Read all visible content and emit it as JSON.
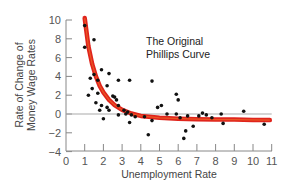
{
  "chart_data": {
    "type": "scatter",
    "title": "The Original Phillips Curve",
    "annotation": [
      "The Original",
      "Phillips Curve"
    ],
    "xlabel": "Unemployment Rate",
    "ylabel": [
      "Rate of Change of",
      "Money Wage Rates"
    ],
    "xlim": [
      0,
      11
    ],
    "ylim": [
      -4,
      10
    ],
    "x_ticks": [
      0,
      1,
      2,
      3,
      4,
      5,
      6,
      7,
      8,
      9,
      10,
      11
    ],
    "y_ticks": [
      10,
      8,
      6,
      4,
      2,
      0,
      -2,
      -4
    ],
    "grid": false,
    "zero_line": true,
    "series": [
      {
        "name": "Observations",
        "kind": "scatter",
        "color": "#111111",
        "points": [
          [
            1.0,
            9.4
          ],
          [
            1.0,
            7.1
          ],
          [
            1.5,
            7.9
          ],
          [
            1.3,
            3.8
          ],
          [
            1.5,
            4.2
          ],
          [
            1.7,
            3.6
          ],
          [
            1.9,
            4.7
          ],
          [
            2.3,
            4.3
          ],
          [
            2.8,
            3.6
          ],
          [
            3.4,
            3.6
          ],
          [
            1.4,
            2.7
          ],
          [
            1.7,
            2.2
          ],
          [
            2.2,
            3.0
          ],
          [
            2.5,
            1.9
          ],
          [
            2.7,
            1.5
          ],
          [
            1.2,
            2.0
          ],
          [
            1.6,
            1.2
          ],
          [
            1.9,
            0.9
          ],
          [
            2.2,
            0.7
          ],
          [
            2.6,
            1.8
          ],
          [
            2.8,
            0.9
          ],
          [
            3.1,
            0.4
          ],
          [
            3.3,
            0.2
          ],
          [
            1.8,
            0.4
          ],
          [
            2.0,
            -0.5
          ],
          [
            2.3,
            0.4
          ],
          [
            2.8,
            -0.1
          ],
          [
            3.2,
            0.0
          ],
          [
            3.5,
            -0.1
          ],
          [
            3.7,
            -0.3
          ],
          [
            3.4,
            -0.9
          ],
          [
            4.2,
            -0.3
          ],
          [
            4.4,
            -2.2
          ],
          [
            4.6,
            3.5
          ],
          [
            4.9,
            0.7
          ],
          [
            5.1,
            0.9
          ],
          [
            4.6,
            -0.7
          ],
          [
            5.4,
            0.0
          ],
          [
            5.9,
            2.1
          ],
          [
            6.0,
            1.5
          ],
          [
            5.9,
            0.0
          ],
          [
            6.1,
            -0.4
          ],
          [
            6.3,
            -2.6
          ],
          [
            6.4,
            -1.8
          ],
          [
            6.5,
            -0.2
          ],
          [
            6.8,
            -1.3
          ],
          [
            7.1,
            -0.2
          ],
          [
            7.3,
            0.1
          ],
          [
            7.5,
            -0.1
          ],
          [
            7.8,
            -0.4
          ],
          [
            8.3,
            0.0
          ],
          [
            8.4,
            -1.0
          ],
          [
            9.5,
            0.3
          ],
          [
            10.6,
            -1.1
          ]
        ]
      },
      {
        "name": "Phillips curve (fitted)",
        "kind": "line",
        "color": "#e0241c",
        "points": [
          [
            1.0,
            10.2
          ],
          [
            1.2,
            7.2
          ],
          [
            1.4,
            5.3
          ],
          [
            1.6,
            4.0
          ],
          [
            1.8,
            3.0
          ],
          [
            2.0,
            2.3
          ],
          [
            2.3,
            1.5
          ],
          [
            2.6,
            0.95
          ],
          [
            3.0,
            0.45
          ],
          [
            3.5,
            0.05
          ],
          [
            4.0,
            -0.2
          ],
          [
            5.0,
            -0.4
          ],
          [
            6.0,
            -0.5
          ],
          [
            7.0,
            -0.55
          ],
          [
            8.0,
            -0.6
          ],
          [
            9.0,
            -0.6
          ],
          [
            10.0,
            -0.63
          ],
          [
            10.9,
            -0.65
          ]
        ]
      }
    ]
  }
}
